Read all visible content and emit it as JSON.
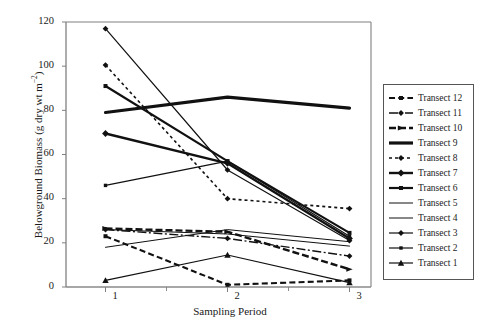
{
  "chart_data": {
    "type": "line",
    "title": "",
    "xlabel": "Sampling Period",
    "ylabel": "Belowground Biomass (g dry wt m-2)",
    "ylabel_main": "Belowground Biomass (g dry wt m",
    "ylabel_sup": "−2",
    "ylabel_tail": ")",
    "categories": [
      "1",
      "2",
      "3"
    ],
    "x": [
      1,
      2,
      3
    ],
    "xlim": [
      0.6,
      3.4
    ],
    "ylim": [
      0,
      120
    ],
    "yticks": [
      0,
      20,
      40,
      60,
      80,
      100,
      120
    ],
    "xticks": [
      "1",
      "2",
      "3"
    ],
    "grid": false,
    "legend_position": "right-outside",
    "series": [
      {
        "name": "Transect 12",
        "values": [
          23,
          1,
          3
        ],
        "style": "dashed-thick",
        "marker": "square",
        "width": 2.1,
        "dash": "6,3.2"
      },
      {
        "name": "Transect 11",
        "values": [
          26,
          22,
          14
        ],
        "style": "dashdot",
        "marker": "diamond",
        "width": 1.4,
        "dash": "9,2.5,2,2.5"
      },
      {
        "name": "Transect 10",
        "values": [
          26.5,
          25,
          8
        ],
        "style": "dashed-wide",
        "marker": "arrow",
        "width": 2.4,
        "dash": "7,3"
      },
      {
        "name": "Transect 9",
        "values": [
          79,
          86,
          81
        ],
        "style": "solid-heavy",
        "marker": "none",
        "width": 3.2,
        "dash": ""
      },
      {
        "name": "Transect 8",
        "values": [
          100.5,
          40,
          35.5
        ],
        "style": "dotted",
        "marker": "diamond",
        "width": 1.6,
        "dash": "3,3"
      },
      {
        "name": "Transect 7",
        "values": [
          69.5,
          56,
          22
        ],
        "style": "solid-bold",
        "marker": "diamond",
        "width": 2.4,
        "dash": ""
      },
      {
        "name": "Transect 6",
        "values": [
          91,
          57,
          24.5
        ],
        "style": "solid-bold",
        "marker": "square",
        "width": 2.2,
        "dash": ""
      },
      {
        "name": "Transect 5",
        "values": [
          18,
          26,
          20.5
        ],
        "style": "solid-thin",
        "marker": "none",
        "width": 1.0,
        "dash": ""
      },
      {
        "name": "Transect 4",
        "values": [
          26,
          24,
          18.5
        ],
        "style": "solid-thin",
        "marker": "none",
        "width": 1.0,
        "dash": ""
      },
      {
        "name": "Transect 3",
        "values": [
          117,
          53,
          21
        ],
        "style": "solid-thin",
        "marker": "diamond",
        "width": 1.2,
        "dash": ""
      },
      {
        "name": "Transect 2",
        "values": [
          46,
          57,
          23
        ],
        "style": "solid-thin",
        "marker": "square",
        "width": 1.2,
        "dash": ""
      },
      {
        "name": "Transect 1",
        "values": [
          3,
          14.5,
          2
        ],
        "style": "solid-thin",
        "marker": "triangle",
        "width": 1.2,
        "dash": ""
      }
    ]
  },
  "axes": {
    "x_title": "Sampling Period",
    "y_tick_labels": [
      "0",
      "20",
      "40",
      "60",
      "80",
      "100",
      "120"
    ],
    "x_tick_labels": [
      "1",
      "2",
      "3"
    ]
  },
  "legend": {
    "items": [
      {
        "label": "Transect 12"
      },
      {
        "label": "Transect 11"
      },
      {
        "label": "Transect 10"
      },
      {
        "label": "Transect 9"
      },
      {
        "label": "Transect 8"
      },
      {
        "label": "Transect 7"
      },
      {
        "label": "Transect 6"
      },
      {
        "label": "Transect 5"
      },
      {
        "label": "Transect 4"
      },
      {
        "label": "Transect 3"
      },
      {
        "label": "Transect 2"
      },
      {
        "label": "Transect 1"
      }
    ]
  },
  "colors": {
    "line": "#111111",
    "axis": "#808080",
    "legend_border": "#555555",
    "background": "#ffffff"
  }
}
